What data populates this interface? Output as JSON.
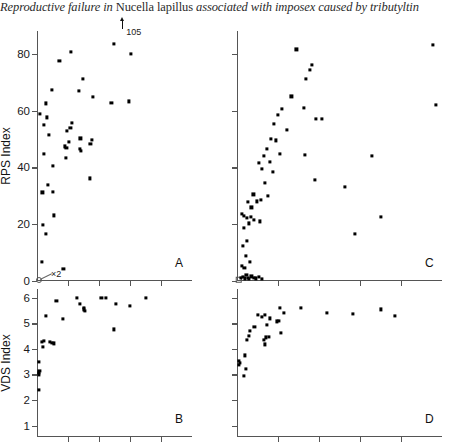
{
  "running_head": {
    "prefix": "Reproductive failure in ",
    "species": "Nucella lapillus",
    "suffix": " associated with imposex caused by tributyltin"
  },
  "figure": {
    "panels": [
      {
        "id": "A",
        "letter": "A",
        "ylabel": "RPS Index",
        "y_ticks": [
          0,
          20,
          40,
          60,
          80
        ],
        "ylim": [
          0,
          88
        ],
        "xlim": [
          0,
          100
        ],
        "x_tick_count": 4,
        "show_y_labels": true,
        "annotations": [
          {
            "text": "105",
            "note": "off-scale point marked with up arrow"
          },
          {
            "text": "×2",
            "note": "two coincident points at origin"
          }
        ]
      },
      {
        "id": "C",
        "letter": "C",
        "ylabel": "",
        "y_ticks": [
          0,
          20,
          40,
          60,
          80
        ],
        "ylim": [
          0,
          88
        ],
        "xlim": [
          0,
          100
        ],
        "x_tick_count": 4,
        "show_y_labels": false,
        "annotations": []
      },
      {
        "id": "B",
        "letter": "B",
        "ylabel": "VDS Index",
        "y_ticks": [
          1,
          2,
          3,
          4,
          5,
          6
        ],
        "ylim": [
          0.55,
          6.35
        ],
        "xlim": [
          0,
          100
        ],
        "x_tick_count": 4,
        "show_y_labels": true,
        "annotations": []
      },
      {
        "id": "D",
        "letter": "D",
        "ylabel": "",
        "y_ticks": [
          1,
          2,
          3,
          4,
          5,
          6
        ],
        "ylim": [
          0.55,
          6.35
        ],
        "xlim": [
          0,
          100
        ],
        "x_tick_count": 4,
        "show_y_labels": false,
        "annotations": []
      }
    ]
  },
  "chart_data": [
    {
      "type": "scatter",
      "panel": "A",
      "title": "",
      "xlabel": "",
      "ylabel": "RPS Index",
      "xlim": [
        0,
        100
      ],
      "ylim": [
        0,
        88
      ],
      "yticks": [
        0,
        20,
        40,
        60,
        80
      ],
      "grid": false,
      "legend": null,
      "annotations": [
        {
          "text": "105",
          "x": 55,
          "y": 88,
          "type": "off-scale-arrow"
        },
        {
          "text": "×2",
          "x": 2,
          "y": 0,
          "type": "multiplicity"
        }
      ],
      "points": [
        {
          "x": 1.5,
          "y": 0.3,
          "marker": "open-circle"
        },
        {
          "x": 3.0,
          "y": 6.8
        },
        {
          "x": 4.0,
          "y": 19.8
        },
        {
          "x": 5.5,
          "y": 16.6
        },
        {
          "x": 2.0,
          "y": 58.7
        },
        {
          "x": 4.5,
          "y": 55.0
        },
        {
          "x": 6.5,
          "y": 57.6
        },
        {
          "x": 7.5,
          "y": 51.4
        },
        {
          "x": 5.5,
          "y": 62.5
        },
        {
          "x": 4.5,
          "y": 44.8
        },
        {
          "x": 3.5,
          "y": 31.2
        },
        {
          "x": 7.0,
          "y": 33.8
        },
        {
          "x": 9.5,
          "y": 67.3
        },
        {
          "x": 10.5,
          "y": 40.6
        },
        {
          "x": 10.0,
          "y": 31.4
        },
        {
          "x": 11.0,
          "y": 23.1
        },
        {
          "x": 14.5,
          "y": 77.5
        },
        {
          "x": 17.0,
          "y": 4.3
        },
        {
          "x": 22.0,
          "y": 80.5
        },
        {
          "x": 19.5,
          "y": 52.8
        },
        {
          "x": 21.5,
          "y": 54.0
        },
        {
          "x": 22.5,
          "y": 55.6
        },
        {
          "x": 20.5,
          "y": 48.9
        },
        {
          "x": 19.0,
          "y": 46.8
        },
        {
          "x": 18.5,
          "y": 43.2
        },
        {
          "x": 18.0,
          "y": 47.4
        },
        {
          "x": 29.5,
          "y": 71.0
        },
        {
          "x": 27.0,
          "y": 67.0
        },
        {
          "x": 27.5,
          "y": 46.5
        },
        {
          "x": 28.5,
          "y": 45.9
        },
        {
          "x": 28.0,
          "y": 50.2
        },
        {
          "x": 36.0,
          "y": 64.9
        },
        {
          "x": 34.5,
          "y": 48.2
        },
        {
          "x": 34.0,
          "y": 36.1
        },
        {
          "x": 35.5,
          "y": 49.6
        },
        {
          "x": 49.5,
          "y": 83.5
        },
        {
          "x": 48.0,
          "y": 62.7
        },
        {
          "x": 60.5,
          "y": 80.0
        },
        {
          "x": 59.5,
          "y": 63.2
        }
      ]
    },
    {
      "type": "scatter",
      "panel": "C",
      "title": "",
      "xlabel": "",
      "ylabel": "RPS Index",
      "xlim": [
        0,
        100
      ],
      "ylim": [
        0,
        88
      ],
      "yticks": [
        0,
        20,
        40,
        60,
        80
      ],
      "grid": false,
      "legend": null,
      "annotations": [],
      "points": [
        {
          "x": 0.8,
          "y": 0.4,
          "marker": "open-square"
        },
        {
          "x": 2.0,
          "y": 1.0
        },
        {
          "x": 3.0,
          "y": 1.4
        },
        {
          "x": 3.8,
          "y": 0.9
        },
        {
          "x": 4.6,
          "y": 2.2
        },
        {
          "x": 5.2,
          "y": 1.2
        },
        {
          "x": 6.0,
          "y": 0.8
        },
        {
          "x": 7.0,
          "y": 1.6
        },
        {
          "x": 8.2,
          "y": 1.0
        },
        {
          "x": 9.4,
          "y": 0.9
        },
        {
          "x": 10.5,
          "y": 1.3
        },
        {
          "x": 12.0,
          "y": 0.8
        },
        {
          "x": 2.5,
          "y": 5.3
        },
        {
          "x": 3.6,
          "y": 4.6
        },
        {
          "x": 4.4,
          "y": 8.7
        },
        {
          "x": 6.2,
          "y": 6.6
        },
        {
          "x": 2.8,
          "y": 12.4
        },
        {
          "x": 4.8,
          "y": 14.1
        },
        {
          "x": 3.2,
          "y": 18.6
        },
        {
          "x": 5.8,
          "y": 20.3
        },
        {
          "x": 2.2,
          "y": 23.5
        },
        {
          "x": 3.4,
          "y": 23.0
        },
        {
          "x": 5.0,
          "y": 22.1
        },
        {
          "x": 6.6,
          "y": 22.6
        },
        {
          "x": 8.4,
          "y": 21.5
        },
        {
          "x": 11.0,
          "y": 21.0
        },
        {
          "x": 7.0,
          "y": 25.9
        },
        {
          "x": 5.4,
          "y": 27.9
        },
        {
          "x": 8.0,
          "y": 30.5
        },
        {
          "x": 9.8,
          "y": 28.0
        },
        {
          "x": 11.8,
          "y": 28.5
        },
        {
          "x": 13.5,
          "y": 34.5
        },
        {
          "x": 15.2,
          "y": 30.0
        },
        {
          "x": 12.0,
          "y": 39.4
        },
        {
          "x": 10.5,
          "y": 41.5
        },
        {
          "x": 13.0,
          "y": 44.0
        },
        {
          "x": 14.5,
          "y": 46.5
        },
        {
          "x": 16.5,
          "y": 50.0
        },
        {
          "x": 18.2,
          "y": 55.2
        },
        {
          "x": 19.0,
          "y": 49.5
        },
        {
          "x": 20.0,
          "y": 58.6
        },
        {
          "x": 22.0,
          "y": 60.5
        },
        {
          "x": 24.5,
          "y": 53.2
        },
        {
          "x": 16.0,
          "y": 42.0
        },
        {
          "x": 17.5,
          "y": 38.5
        },
        {
          "x": 21.0,
          "y": 44.6
        },
        {
          "x": 26.5,
          "y": 65.0
        },
        {
          "x": 29.0,
          "y": 81.5
        },
        {
          "x": 33.5,
          "y": 71.2
        },
        {
          "x": 35.5,
          "y": 74.2
        },
        {
          "x": 36.5,
          "y": 76.2
        },
        {
          "x": 32.5,
          "y": 61.0
        },
        {
          "x": 33.0,
          "y": 44.5
        },
        {
          "x": 38.5,
          "y": 57.0
        },
        {
          "x": 41.5,
          "y": 57.2
        },
        {
          "x": 38.0,
          "y": 35.5
        },
        {
          "x": 52.5,
          "y": 33.0
        },
        {
          "x": 57.5,
          "y": 16.5
        },
        {
          "x": 66.0,
          "y": 44.1
        },
        {
          "x": 70.0,
          "y": 22.5
        },
        {
          "x": 95.5,
          "y": 83.0
        },
        {
          "x": 97.0,
          "y": 62.0
        }
      ]
    },
    {
      "type": "scatter",
      "panel": "B",
      "title": "",
      "xlabel": "",
      "ylabel": "VDS Index",
      "xlim": [
        0,
        100
      ],
      "ylim": [
        0.55,
        6.35
      ],
      "yticks": [
        1,
        2,
        3,
        4,
        5,
        6
      ],
      "grid": false,
      "legend": null,
      "annotations": [],
      "points": [
        {
          "x": 1.2,
          "y": 2.4
        },
        {
          "x": 1.2,
          "y": 3.0
        },
        {
          "x": 1.4,
          "y": 3.05
        },
        {
          "x": 1.6,
          "y": 3.15
        },
        {
          "x": 1.3,
          "y": 3.5
        },
        {
          "x": 3.2,
          "y": 4.28
        },
        {
          "x": 4.6,
          "y": 4.3
        },
        {
          "x": 4.0,
          "y": 4.08
        },
        {
          "x": 8.5,
          "y": 4.28
        },
        {
          "x": 9.8,
          "y": 4.25
        },
        {
          "x": 11.0,
          "y": 4.22
        },
        {
          "x": 6.0,
          "y": 5.3
        },
        {
          "x": 12.5,
          "y": 5.88
        },
        {
          "x": 16.5,
          "y": 5.17
        },
        {
          "x": 25.5,
          "y": 6.0
        },
        {
          "x": 27.5,
          "y": 5.78
        },
        {
          "x": 30.0,
          "y": 5.55
        },
        {
          "x": 30.5,
          "y": 5.62
        },
        {
          "x": 31.0,
          "y": 5.5
        },
        {
          "x": 41.5,
          "y": 6.0
        },
        {
          "x": 44.5,
          "y": 6.0
        },
        {
          "x": 49.5,
          "y": 4.77
        },
        {
          "x": 51.0,
          "y": 5.78
        },
        {
          "x": 60.0,
          "y": 5.7
        },
        {
          "x": 70.5,
          "y": 6.0
        }
      ]
    },
    {
      "type": "scatter",
      "panel": "D",
      "title": "",
      "xlabel": "",
      "ylabel": "VDS Index",
      "xlim": [
        0,
        100
      ],
      "ylim": [
        0.55,
        6.35
      ],
      "yticks": [
        1,
        2,
        3,
        4,
        5,
        6
      ],
      "grid": false,
      "legend": null,
      "annotations": [],
      "points": [
        {
          "x": 0.8,
          "y": 3.52
        },
        {
          "x": 1.6,
          "y": 3.45
        },
        {
          "x": 1.0,
          "y": 3.38
        },
        {
          "x": 4.2,
          "y": 3.22
        },
        {
          "x": 3.8,
          "y": 3.75
        },
        {
          "x": 3.5,
          "y": 2.95
        },
        {
          "x": 5.0,
          "y": 4.35
        },
        {
          "x": 6.2,
          "y": 4.72
        },
        {
          "x": 6.0,
          "y": 4.52
        },
        {
          "x": 8.5,
          "y": 4.85
        },
        {
          "x": 10.0,
          "y": 5.32
        },
        {
          "x": 12.0,
          "y": 5.25
        },
        {
          "x": 13.5,
          "y": 5.35
        },
        {
          "x": 14.5,
          "y": 4.95
        },
        {
          "x": 16.0,
          "y": 5.2
        },
        {
          "x": 13.0,
          "y": 4.35
        },
        {
          "x": 14.0,
          "y": 4.45
        },
        {
          "x": 15.5,
          "y": 4.48
        },
        {
          "x": 13.8,
          "y": 4.18
        },
        {
          "x": 19.5,
          "y": 5.08
        },
        {
          "x": 20.5,
          "y": 5.1
        },
        {
          "x": 21.0,
          "y": 5.6
        },
        {
          "x": 23.0,
          "y": 5.42
        },
        {
          "x": 21.5,
          "y": 4.62
        },
        {
          "x": 31.0,
          "y": 5.62
        },
        {
          "x": 44.0,
          "y": 5.42
        },
        {
          "x": 56.5,
          "y": 5.38
        },
        {
          "x": 70.0,
          "y": 5.55
        },
        {
          "x": 77.0,
          "y": 5.3
        }
      ]
    }
  ]
}
